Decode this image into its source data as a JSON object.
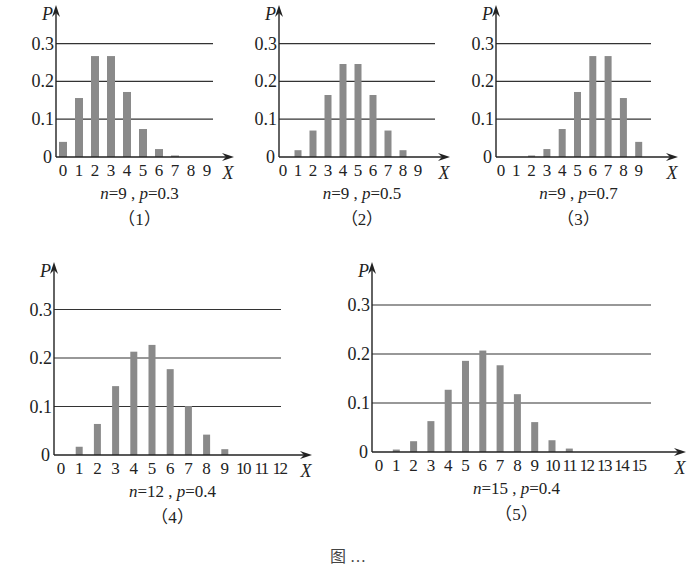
{
  "figure_caption": "图 …",
  "chart_data": [
    {
      "type": "bar",
      "title": "n=9 , p=0.3",
      "number": "（1）",
      "xlabel": "X",
      "ylabel": "P",
      "categories": [
        "0",
        "1",
        "2",
        "3",
        "4",
        "5",
        "6",
        "7",
        "8",
        "9"
      ],
      "values": [
        0.04,
        0.156,
        0.267,
        0.267,
        0.172,
        0.074,
        0.021,
        0.004,
        0.0,
        0.0
      ],
      "yticks": [
        "0",
        "0.1",
        "0.2",
        "0.3"
      ],
      "ylim": [
        0,
        0.33
      ],
      "grid": true,
      "layout": {
        "ox": 56,
        "baseline": 157,
        "unit": 378,
        "x0": 63,
        "dx": 16,
        "xend": 234,
        "ytop": 5,
        "gridend": 213,
        "barw": 8
      }
    },
    {
      "type": "bar",
      "title": "n=9 , p=0.5",
      "number": "（2）",
      "xlabel": "X",
      "ylabel": "P",
      "categories": [
        "0",
        "1",
        "2",
        "3",
        "4",
        "5",
        "6",
        "7",
        "8",
        "9"
      ],
      "values": [
        0.002,
        0.018,
        0.07,
        0.164,
        0.246,
        0.246,
        0.164,
        0.07,
        0.018,
        0.002
      ],
      "yticks": [
        "0",
        "0.1",
        "0.2",
        "0.3"
      ],
      "ylim": [
        0,
        0.33
      ],
      "grid": true,
      "layout": {
        "ox": 279,
        "baseline": 157,
        "unit": 378,
        "x0": 283,
        "dx": 15,
        "xend": 450,
        "ytop": 5,
        "gridend": 435,
        "barw": 7
      }
    },
    {
      "type": "bar",
      "title": "n=9 , p=0.7",
      "number": "（3）",
      "xlabel": "X",
      "ylabel": "P",
      "categories": [
        "0",
        "1",
        "2",
        "3",
        "4",
        "5",
        "6",
        "7",
        "8",
        "9"
      ],
      "values": [
        0.0,
        0.0,
        0.004,
        0.021,
        0.074,
        0.172,
        0.267,
        0.267,
        0.156,
        0.04
      ],
      "yticks": [
        "0",
        "0.1",
        "0.2",
        "0.3"
      ],
      "ylim": [
        0,
        0.33
      ],
      "grid": true,
      "layout": {
        "ox": 496,
        "baseline": 157,
        "unit": 378,
        "x0": 501,
        "dx": 15.3,
        "xend": 678,
        "ytop": 5,
        "gridend": 651,
        "barw": 7
      }
    },
    {
      "type": "bar",
      "title": "n=12 , p=0.4",
      "number": "（4）",
      "xlabel": "X",
      "ylabel": "P",
      "categories": [
        "0",
        "1",
        "2",
        "3",
        "4",
        "5",
        "6",
        "7",
        "8",
        "9",
        "10",
        "11",
        "12"
      ],
      "values": [
        0.002,
        0.017,
        0.064,
        0.142,
        0.213,
        0.227,
        0.177,
        0.101,
        0.042,
        0.012,
        0.002,
        0.0,
        0.0
      ],
      "yticks": [
        "0",
        "0.1",
        "0.2",
        "0.3"
      ],
      "ylim": [
        0,
        0.33
      ],
      "grid": true,
      "layout": {
        "ox": 54,
        "baseline": 455,
        "unit": 485,
        "x0": 61,
        "dx": 18.2,
        "xend": 312,
        "ytop": 262,
        "gridend": 281,
        "barw": 7
      }
    },
    {
      "type": "bar",
      "title": "n=15 , p=0.4",
      "number": "（5）",
      "xlabel": "X",
      "ylabel": "P",
      "categories": [
        "0",
        "1",
        "2",
        "3",
        "4",
        "5",
        "6",
        "7",
        "8",
        "9",
        "10",
        "11",
        "12",
        "13",
        "14",
        "15"
      ],
      "values": [
        0.0005,
        0.005,
        0.022,
        0.063,
        0.127,
        0.186,
        0.207,
        0.177,
        0.118,
        0.061,
        0.024,
        0.007,
        0.002,
        0.0,
        0.0,
        0.0
      ],
      "yticks": [
        "0",
        "0.1",
        "0.2",
        "0.3"
      ],
      "ylim": [
        0,
        0.33
      ],
      "grid": true,
      "layout": {
        "ox": 372,
        "baseline": 452,
        "unit": 490,
        "x0": 379,
        "dx": 17.3,
        "xend": 686,
        "ytop": 262,
        "gridend": 651,
        "barw": 7
      }
    }
  ]
}
